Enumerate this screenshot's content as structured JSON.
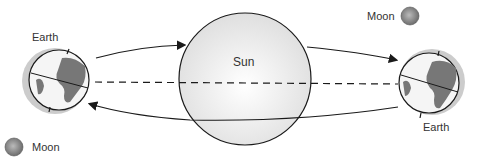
{
  "diagram": {
    "labels": {
      "sun": "Sun",
      "earth_left": "Earth",
      "earth_right": "Earth",
      "moon_top": "Moon",
      "moon_bottom": "Moon"
    },
    "colors": {
      "outline": "#1a1a1a",
      "sun_fill": "#eeeeee",
      "land": "#777777",
      "ocean": "#f5f5f5",
      "shadow": "#cccccc",
      "moon": "#999999"
    }
  }
}
